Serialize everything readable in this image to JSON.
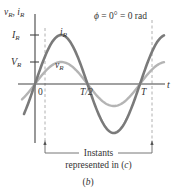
{
  "figure": {
    "panel_label": "(b)",
    "phase_label": "ϕ = 0° = 0 rad",
    "y_axis_label": "v_R, i_R",
    "x_axis_label": "t",
    "ticks": {
      "x": [
        {
          "label": "0",
          "x": 35
        },
        {
          "label": "T/2",
          "x": 88
        },
        {
          "label": "T",
          "x": 140
        }
      ],
      "y": [
        {
          "label": "I_R",
          "y": 35
        },
        {
          "label": "V_R",
          "y": 62
        }
      ]
    },
    "curves": [
      {
        "name": "i_R",
        "label": "i_R",
        "amplitude_px": 49,
        "color": "#7a7a7a",
        "width": 2.6
      },
      {
        "name": "v_R",
        "label": "v_R",
        "amplitude_px": 22,
        "color": "#b4b4b4",
        "width": 2.4
      }
    ],
    "bracket": {
      "line1": "Instants",
      "line2": "represented in (c)"
    },
    "colors": {
      "axis": "#444444",
      "dashed": "#aaaaaa",
      "text": "#333333"
    }
  }
}
